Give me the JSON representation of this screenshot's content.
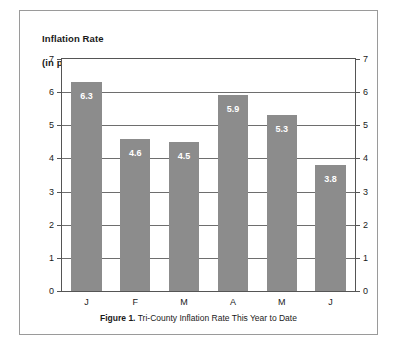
{
  "figure": {
    "caption_label": "Figure 1.",
    "caption_text": "Tri-County Inflation Rate This Year to Date"
  },
  "axis_title": {
    "line1": "Inflation Rate",
    "line2": "(in percent)"
  },
  "colors": {
    "bar_fill": "#8c8c8c",
    "value_label": "#ffffff",
    "gridline": "#6e6e6e",
    "axis": "#555555",
    "frame_border": "#9a9a9a",
    "background": "#ffffff"
  },
  "chart_data": {
    "type": "bar",
    "title": "Inflation Rate (in percent)",
    "xlabel": "",
    "ylabel": "Inflation Rate (in percent)",
    "categories": [
      "J",
      "F",
      "M",
      "A",
      "M",
      "J"
    ],
    "values": [
      6.3,
      4.6,
      4.5,
      5.9,
      5.3,
      3.8
    ],
    "value_labels": [
      "6.3",
      "4.6",
      "4.5",
      "5.9",
      "5.3",
      "3.8"
    ],
    "ylim": [
      0,
      7
    ],
    "yticks": [
      0,
      1,
      2,
      3,
      4,
      5,
      6,
      7
    ],
    "ytick_labels_left": [
      "0",
      "1",
      "2",
      "3",
      "4",
      "5",
      "6",
      "7"
    ],
    "ytick_labels_right": [
      "0",
      "1",
      "2",
      "3",
      "4",
      "5",
      "6",
      "7"
    ],
    "grid": true,
    "legend": null,
    "dual_axis": true
  }
}
